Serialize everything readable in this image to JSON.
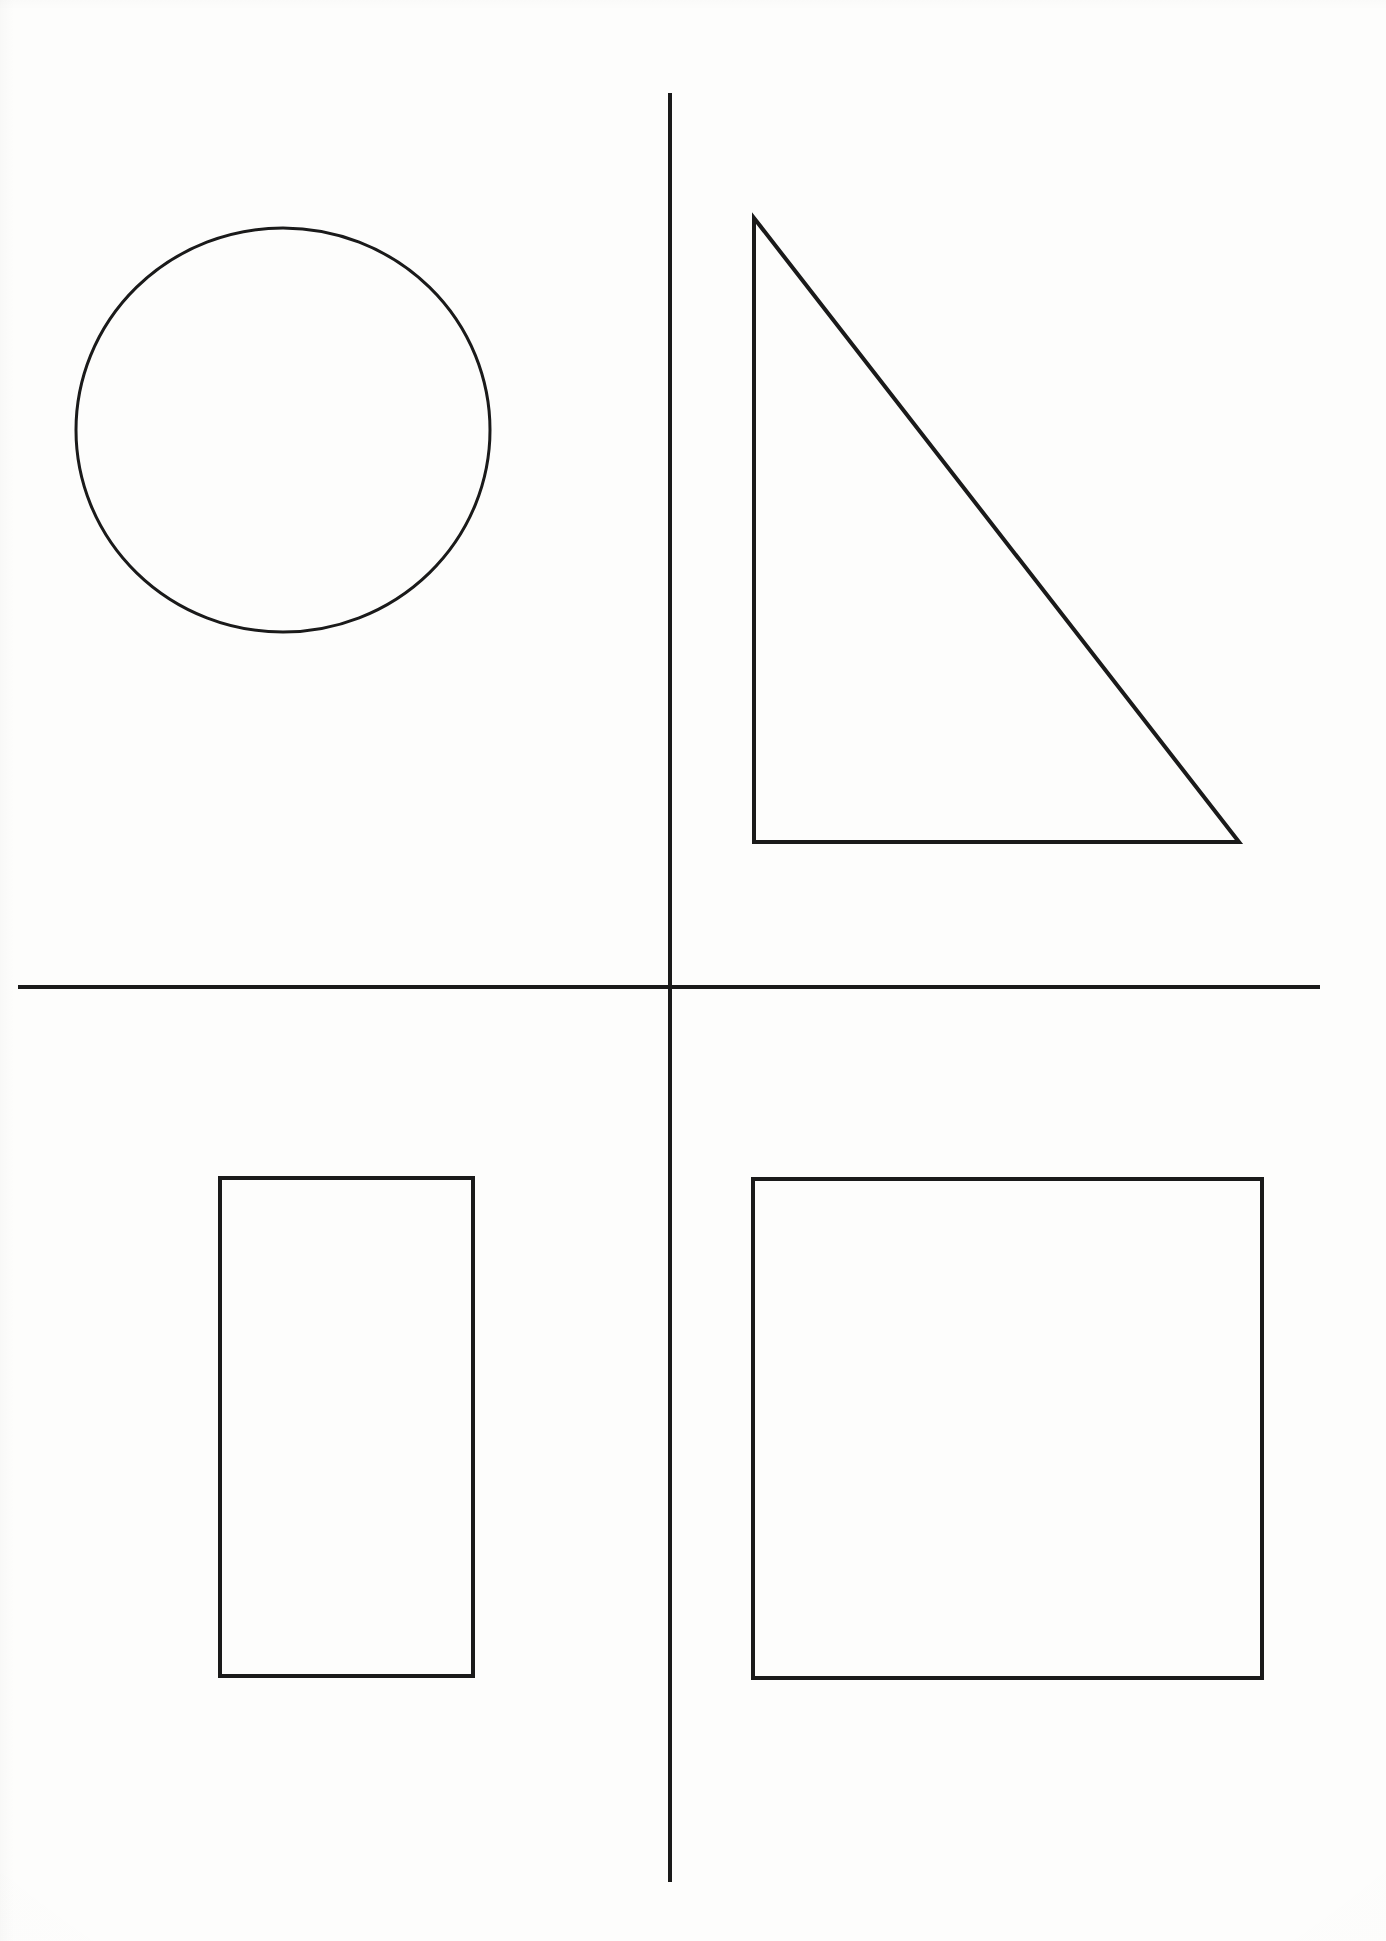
{
  "page": {
    "width": 1386,
    "height": 1941,
    "background_color": "#fdfdfc",
    "ink_color": "#1a1a1a"
  },
  "divider": {
    "vertical": {
      "name": "vertical-divider-line",
      "x": 670,
      "y1": 93,
      "y2": 1882,
      "stroke_width": 4,
      "color": "#1a1a1a"
    },
    "horizontal": {
      "name": "horizontal-divider-line",
      "x1": 18,
      "x2": 1320,
      "y": 987,
      "stroke_width": 4,
      "color": "#1a1a1a"
    }
  },
  "shapes": [
    {
      "name": "circle",
      "quadrant": "top-left",
      "type": "ellipse",
      "cx": 283,
      "cy": 430,
      "rx": 207,
      "ry": 202,
      "stroke_width": 3,
      "fill": "none",
      "color": "#1a1a1a"
    },
    {
      "name": "right-triangle",
      "quadrant": "top-right",
      "type": "polygon",
      "points": "754,218 754,842 1239,842",
      "vertices": [
        {
          "label": "apex",
          "x": 754,
          "y": 218
        },
        {
          "label": "bottom-left",
          "x": 754,
          "y": 842
        },
        {
          "label": "bottom-right",
          "x": 1239,
          "y": 842
        }
      ],
      "stroke_width": 4,
      "fill": "none",
      "color": "#1a1a1a"
    },
    {
      "name": "rectangle",
      "quadrant": "bottom-left",
      "type": "rect",
      "x": 220,
      "y": 1178,
      "width": 253,
      "height": 498,
      "stroke_width": 4,
      "fill": "none",
      "color": "#1a1a1a"
    },
    {
      "name": "square",
      "quadrant": "bottom-right",
      "type": "rect",
      "x": 753,
      "y": 1179,
      "width": 509,
      "height": 499,
      "stroke_width": 4,
      "fill": "none",
      "color": "#1a1a1a"
    }
  ]
}
